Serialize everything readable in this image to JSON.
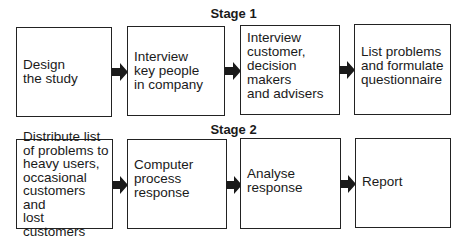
{
  "stages": [
    {
      "title": "Stage 1",
      "steps": [
        {
          "label": "Design\nthe study"
        },
        {
          "label": "Interview\nkey people\nin company"
        },
        {
          "label": "Interview\ncustomer,\ndecision makers\nand advisers"
        },
        {
          "label": "List problems\nand formulate\nquestionnaire"
        }
      ]
    },
    {
      "title": "Stage 2",
      "steps": [
        {
          "label": "Distribute list\nof problems to\nheavy users,\noccasional\ncustomers and\nlost customers"
        },
        {
          "label": "Computer\nprocess\nresponse"
        },
        {
          "label": "Analyse\nresponse"
        },
        {
          "label": "Report"
        }
      ]
    }
  ],
  "colors": {
    "border": "#222222",
    "arrow": "#1a1a1a",
    "background": "#ffffff"
  }
}
